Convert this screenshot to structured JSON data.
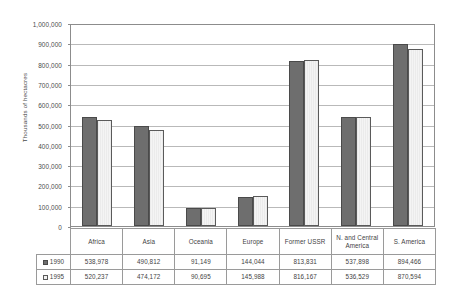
{
  "chart_data": {
    "type": "bar",
    "title": "",
    "xlabel": "",
    "ylabel": "Thousands of hectacres",
    "ylim": [
      0,
      1000000
    ],
    "ytick_labels": [
      "1,000,000",
      "900,000",
      "800,000",
      "700,000",
      "600,000",
      "500,000",
      "400,000",
      "300,000",
      "200,000",
      "100,000",
      "0"
    ],
    "ytick_values": [
      1000000,
      900000,
      800000,
      700000,
      600000,
      500000,
      400000,
      300000,
      200000,
      100000,
      0
    ],
    "grid": true,
    "legend_position": "table-left",
    "categories": [
      "Africa",
      "Asia",
      "Oceania",
      "Europe",
      "Former USSR",
      "N. and Central America",
      "S. America"
    ],
    "series": [
      {
        "name": "1990",
        "color": "#6e6e6e",
        "values": [
          538978,
          490812,
          91149,
          144044,
          813831,
          537898,
          894466
        ],
        "labels": [
          "538,978",
          "490,812",
          "91,149",
          "144,044",
          "813,831",
          "537,898",
          "894,466"
        ]
      },
      {
        "name": "1995",
        "color": "#ececec",
        "values": [
          520237,
          474172,
          90695,
          145988,
          816167,
          536529,
          870594
        ],
        "labels": [
          "520,237",
          "474,172",
          "90,695",
          "145,988",
          "816,167",
          "536,529",
          "870,594"
        ]
      }
    ]
  },
  "table": {
    "row_label_1990": "1990",
    "row_label_1995": "1995"
  }
}
